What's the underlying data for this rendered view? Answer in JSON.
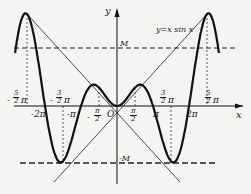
{
  "figure": {
    "function_label": "y=x sin x",
    "y_axis_label": "y",
    "x_axis_label": "x",
    "origin_label": "O",
    "level_upper": "M",
    "level_lower": "-M",
    "caption": "Fig. ..."
  },
  "ticks_below_axis": [
    {
      "id": "neg2pi",
      "label": "-2π"
    },
    {
      "id": "negpi",
      "label": "-π"
    },
    {
      "id": "pi",
      "label": "π"
    },
    {
      "id": "twopi",
      "label": "2π"
    }
  ],
  "fraction_ticks": [
    {
      "id": "neg5half",
      "sign": "-",
      "num": "5",
      "den": "2",
      "suffix": "π"
    },
    {
      "id": "neg3half",
      "sign": "-",
      "num": "3",
      "den": "2",
      "suffix": "π"
    },
    {
      "id": "neghalf",
      "sign": "-",
      "num": "π",
      "den": "2",
      "suffix": ""
    },
    {
      "id": "half",
      "sign": "",
      "num": "π",
      "den": "2",
      "suffix": ""
    },
    {
      "id": "pos3half",
      "sign": "",
      "num": "3",
      "den": "2",
      "suffix": "π"
    },
    {
      "id": "pos5half",
      "sign": "",
      "num": "5",
      "den": "2",
      "suffix": "π"
    }
  ],
  "colors": {
    "curve": "#111111",
    "background": "#f4f4f2"
  }
}
